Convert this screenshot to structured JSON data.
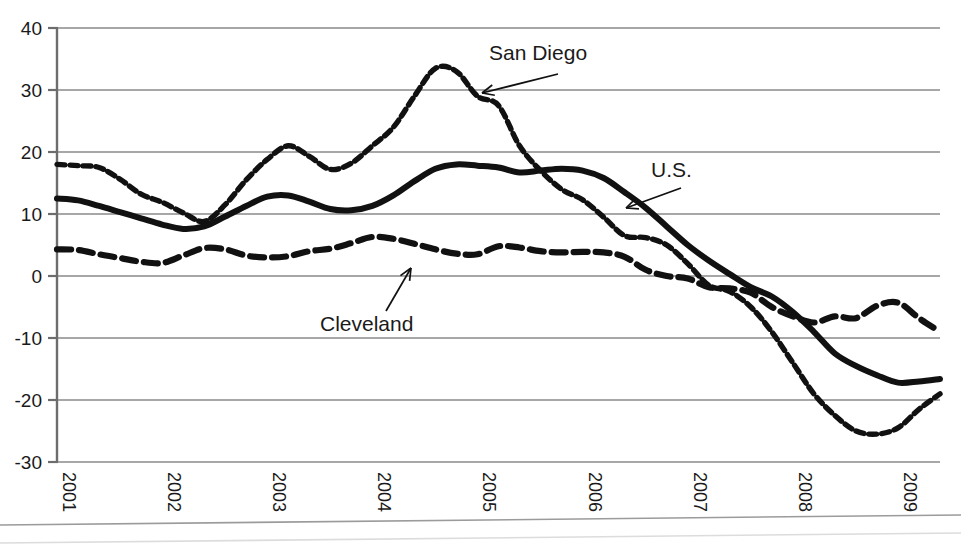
{
  "chart_data": {
    "type": "line",
    "title": "",
    "subtitle": "",
    "xlabel": "",
    "ylabel": "",
    "xlim": [
      2001.0,
      2009.4
    ],
    "ylim": [
      -30,
      40
    ],
    "grid": true,
    "legend_position": "inline-annotations",
    "yticks": [
      40,
      30,
      20,
      10,
      0,
      -10,
      -20,
      -30
    ],
    "ytick_labels": [
      "40",
      "30",
      "20",
      "10",
      "0",
      "-10",
      "-20",
      "-30"
    ],
    "xticks": [
      2001,
      2002,
      2003,
      2004,
      2005,
      2006,
      2007,
      2008,
      2009
    ],
    "xtick_labels": [
      "2001",
      "2002",
      "2003",
      "2004",
      "2005",
      "2006",
      "2007",
      "2008",
      "2009"
    ],
    "xtick_rotation": 90,
    "series": [
      {
        "name": "San Diego",
        "style": "fine-dashed",
        "color": "#111111",
        "x": [
          2001.0,
          2001.2,
          2001.4,
          2001.6,
          2001.8,
          2002.0,
          2002.2,
          2002.4,
          2002.6,
          2002.8,
          2003.0,
          2003.2,
          2003.4,
          2003.6,
          2003.8,
          2004.0,
          2004.2,
          2004.4,
          2004.6,
          2004.8,
          2005.0,
          2005.2,
          2005.4,
          2005.6,
          2005.8,
          2006.0,
          2006.2,
          2006.4,
          2006.6,
          2006.8,
          2007.0,
          2007.2,
          2007.4,
          2007.6,
          2007.8,
          2008.0,
          2008.2,
          2008.4,
          2008.6,
          2008.8,
          2009.0,
          2009.2,
          2009.4
        ],
        "values": [
          18.0,
          17.8,
          17.5,
          15.6,
          13.2,
          11.9,
          10.2,
          8.8,
          11.5,
          15.5,
          18.8,
          21.0,
          19.3,
          17.2,
          18.2,
          21.0,
          24.0,
          29.0,
          33.5,
          33.0,
          29.0,
          27.5,
          21.0,
          17.0,
          14.0,
          12.3,
          9.5,
          6.5,
          6.2,
          5.0,
          2.0,
          -1.5,
          -2.5,
          -5.0,
          -9.0,
          -14.0,
          -19.0,
          -22.5,
          -25.0,
          -25.5,
          -24.5,
          -21.5,
          -19.0
        ]
      },
      {
        "name": "U.S.",
        "style": "solid",
        "color": "#111111",
        "x": [
          2001.0,
          2001.2,
          2001.4,
          2001.6,
          2001.8,
          2002.0,
          2002.2,
          2002.4,
          2002.6,
          2002.8,
          2003.0,
          2003.2,
          2003.4,
          2003.6,
          2003.8,
          2004.0,
          2004.2,
          2004.4,
          2004.6,
          2004.8,
          2005.0,
          2005.2,
          2005.4,
          2005.6,
          2005.8,
          2006.0,
          2006.2,
          2006.4,
          2006.6,
          2006.8,
          2007.0,
          2007.2,
          2007.4,
          2007.6,
          2007.8,
          2008.0,
          2008.2,
          2008.4,
          2008.6,
          2008.8,
          2009.0,
          2009.2,
          2009.4
        ],
        "values": [
          12.5,
          12.2,
          11.3,
          10.3,
          9.3,
          8.3,
          7.6,
          8.0,
          9.6,
          11.3,
          12.8,
          13.0,
          12.0,
          10.8,
          10.6,
          11.3,
          13.0,
          15.3,
          17.3,
          18.0,
          17.8,
          17.5,
          16.7,
          17.0,
          17.3,
          17.0,
          15.8,
          13.5,
          11.0,
          8.0,
          5.0,
          2.5,
          0.3,
          -1.8,
          -3.3,
          -5.8,
          -9.0,
          -12.5,
          -14.5,
          -16.0,
          -17.2,
          -17.0,
          -16.6
        ]
      },
      {
        "name": "Cleveland",
        "style": "coarse-dashed",
        "color": "#111111",
        "x": [
          2001.0,
          2001.2,
          2001.4,
          2001.6,
          2001.8,
          2002.0,
          2002.2,
          2002.4,
          2002.6,
          2002.8,
          2003.0,
          2003.2,
          2003.4,
          2003.6,
          2003.8,
          2004.0,
          2004.2,
          2004.4,
          2004.6,
          2004.8,
          2005.0,
          2005.2,
          2005.4,
          2005.6,
          2005.8,
          2006.0,
          2006.2,
          2006.4,
          2006.6,
          2006.8,
          2007.0,
          2007.2,
          2007.4,
          2007.6,
          2007.8,
          2008.0,
          2008.2,
          2008.4,
          2008.6,
          2008.8,
          2009.0,
          2009.2,
          2009.4
        ],
        "values": [
          4.3,
          4.2,
          3.5,
          2.9,
          2.3,
          2.1,
          3.3,
          4.5,
          4.3,
          3.3,
          3.0,
          3.2,
          4.0,
          4.4,
          5.3,
          6.3,
          6.0,
          5.2,
          4.3,
          3.6,
          3.5,
          4.8,
          4.6,
          4.0,
          3.8,
          3.9,
          3.8,
          3.1,
          1.0,
          0.0,
          -0.4,
          -1.8,
          -2.0,
          -2.7,
          -5.0,
          -6.5,
          -7.5,
          -6.5,
          -6.8,
          -4.8,
          -4.3,
          -6.8,
          -9.0
        ]
      }
    ],
    "annotations": [
      {
        "text": "San Diego",
        "label_x": 489,
        "label_y": 60,
        "arrow_from_x": 558,
        "arrow_from_y": 74,
        "arrow_to_x": 482,
        "arrow_to_y": 93
      },
      {
        "text": "U.S.",
        "label_x": 651,
        "label_y": 177,
        "arrow_from_x": 681,
        "arrow_from_y": 188,
        "arrow_to_x": 626,
        "arrow_to_y": 208
      },
      {
        "text": "Cleveland",
        "label_x": 320,
        "label_y": 331,
        "arrow_from_x": 386,
        "arrow_from_y": 311,
        "arrow_to_x": 411,
        "arrow_to_y": 268
      }
    ]
  }
}
